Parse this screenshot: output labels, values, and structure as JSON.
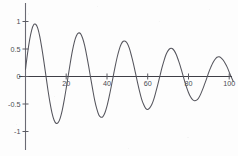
{
  "figure": {
    "background_color": "#fdfdfd",
    "line_color": "#54545c",
    "axis_color": "#5a5a62",
    "text_color": "#4a4a52"
  },
  "chart_data": {
    "type": "line",
    "title": "",
    "subtitle": "",
    "xlabel": "",
    "ylabel": "",
    "xlim": [
      0,
      102
    ],
    "ylim": [
      -1.08,
      1.08
    ],
    "grid": false,
    "legend": null,
    "legend_position": "none",
    "x_ticks": [
      20,
      40,
      60,
      80,
      100
    ],
    "x_tick_labels": [
      "20",
      "40",
      "60",
      "80",
      "100"
    ],
    "y_ticks": [
      1,
      0.5,
      0,
      -0.5,
      -1
    ],
    "y_tick_labels": [
      "1",
      "0.5",
      "0",
      "-0.5",
      "-1"
    ],
    "series": [
      {
        "name": "damped-oscillation",
        "color": "#54545c",
        "x": [
          0,
          1,
          2,
          3,
          4,
          5,
          6,
          7,
          8,
          9,
          10,
          11,
          12,
          13,
          14,
          15,
          16,
          17,
          18,
          19,
          20,
          21,
          22,
          23,
          24,
          25,
          26,
          27,
          28,
          29,
          30,
          31,
          32,
          33,
          34,
          35,
          36,
          37,
          38,
          39,
          40,
          41,
          42,
          43,
          44,
          45,
          46,
          47,
          48,
          49,
          50,
          51,
          52,
          53,
          54,
          55,
          56,
          57,
          58,
          59,
          60,
          61,
          62,
          63,
          64,
          65,
          66,
          67,
          68,
          69,
          70,
          71,
          72,
          73,
          74,
          75,
          76,
          77,
          78,
          79,
          80,
          81,
          82,
          83,
          84,
          85,
          86,
          87,
          88,
          89,
          90,
          91,
          92,
          93,
          94,
          95,
          96,
          97,
          98,
          99,
          100,
          101,
          102
        ],
        "y": [
          0.13,
          0.42,
          0.66,
          0.84,
          0.94,
          0.95,
          0.88,
          0.73,
          0.52,
          0.28,
          0.02,
          -0.24,
          -0.47,
          -0.66,
          -0.79,
          -0.85,
          -0.84,
          -0.76,
          -0.62,
          -0.43,
          -0.21,
          0.02,
          0.25,
          0.46,
          0.63,
          0.74,
          0.79,
          0.78,
          0.7,
          0.57,
          0.39,
          0.19,
          -0.03,
          -0.24,
          -0.44,
          -0.59,
          -0.7,
          -0.74,
          -0.73,
          -0.66,
          -0.54,
          -0.38,
          -0.2,
          -0.01,
          0.18,
          0.35,
          0.49,
          0.59,
          0.64,
          0.64,
          0.6,
          0.51,
          0.38,
          0.23,
          0.06,
          -0.11,
          -0.27,
          -0.41,
          -0.51,
          -0.58,
          -0.6,
          -0.57,
          -0.51,
          -0.41,
          -0.28,
          -0.14,
          0.01,
          0.16,
          0.29,
          0.4,
          0.47,
          0.51,
          0.51,
          0.47,
          0.4,
          0.3,
          0.19,
          0.06,
          -0.07,
          -0.19,
          -0.29,
          -0.37,
          -0.42,
          -0.44,
          -0.43,
          -0.39,
          -0.32,
          -0.23,
          -0.13,
          -0.03,
          0.08,
          0.17,
          0.25,
          0.31,
          0.35,
          0.36,
          0.34,
          0.3,
          0.24,
          0.17,
          0.08,
          -0.01,
          -0.09
        ],
        "peaks": [
          {
            "x": 5,
            "y": 0.95
          },
          {
            "x": 26,
            "y": 0.79
          },
          {
            "x": 46,
            "y": 0.64
          },
          {
            "x": 67,
            "y": 0.51
          },
          {
            "x": 88,
            "y": 0.36
          }
        ],
        "troughs": [
          {
            "x": 15,
            "y": -0.85
          },
          {
            "x": 36,
            "y": -0.74
          },
          {
            "x": 57,
            "y": -0.6
          },
          {
            "x": 78,
            "y": -0.44
          }
        ]
      }
    ]
  }
}
